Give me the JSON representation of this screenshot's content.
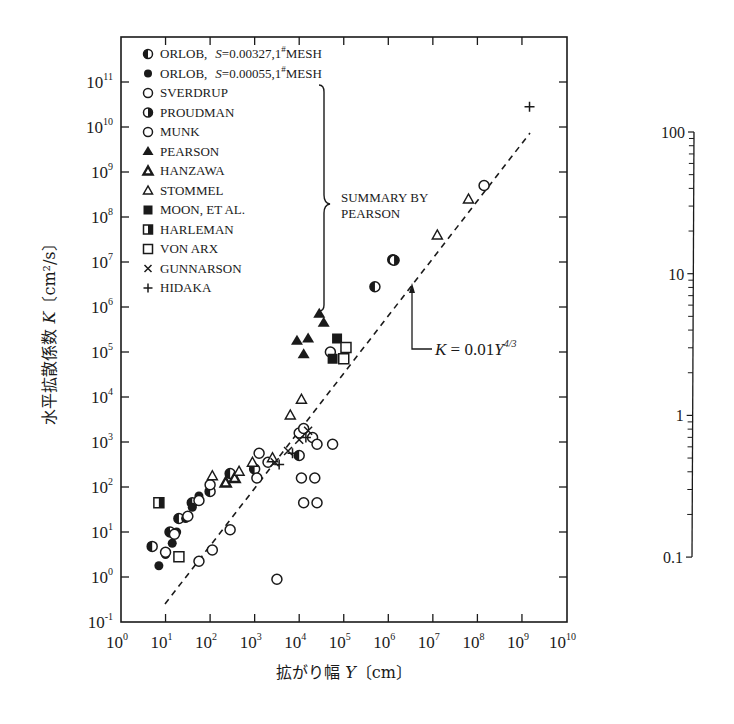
{
  "chart_data": [
    {
      "type": "scatter",
      "title": "",
      "xlabel": "拡がり幅 Y〔cm〕",
      "ylabel": "水平拡散係数 K〔cm²/s〕",
      "xscale": "log",
      "yscale": "log",
      "xlim": [
        1,
        10000000000.0
      ],
      "ylim": [
        0.1,
        1000000000000.0
      ],
      "x_ticks": [
        "10^0",
        "10^1",
        "10^2",
        "10^3",
        "10^4",
        "10^5",
        "10^6",
        "10^7",
        "10^8",
        "10^9",
        "10^10"
      ],
      "y_ticks": [
        "10^-1",
        "10^0",
        "10^1",
        "10^2",
        "10^3",
        "10^4",
        "10^5",
        "10^6",
        "10^7",
        "10^8",
        "10^9",
        "10^10",
        "10^11"
      ],
      "grid": false,
      "legend_position": "upper left (inside)",
      "legend_group_label": "SUMMARY BY PEARSON",
      "annotation": {
        "text": "K = 0.01Y^4/3",
        "arrow_to_log": [
          6.35,
          7.65
        ]
      },
      "fit_line": {
        "label": "K = 0.01Y^(4/3)",
        "style": "dashed",
        "x_range_log": [
          1,
          9.2
        ]
      },
      "series": [
        {
          "name": "ORLOB, S=0.00327, 1#MESH",
          "marker": "circle-half-left",
          "points_log": [
            [
              0.7,
              0.68
            ],
            [
              1.1,
              1.0
            ],
            [
              1.3,
              1.3
            ],
            [
              1.6,
              1.65
            ],
            [
              2.0,
              1.9
            ],
            [
              2.45,
              2.3
            ],
            [
              3.0,
              2.4
            ],
            [
              4.0,
              2.7
            ],
            [
              5.7,
              6.45
            ],
            [
              6.1,
              7.05
            ]
          ]
        },
        {
          "name": "ORLOB, S=0.00055, 1#MESH",
          "marker": "circle-filled",
          "points_log": [
            [
              0.85,
              0.25
            ],
            [
              1.0,
              0.5
            ],
            [
              1.15,
              0.75
            ],
            [
              1.25,
              1.0
            ],
            [
              1.45,
              1.3
            ],
            [
              1.6,
              1.55
            ],
            [
              1.75,
              1.8
            ]
          ]
        },
        {
          "name": "SVERDRUP",
          "marker": "circle-open",
          "points_log": [
            [
              1.0,
              0.55
            ],
            [
              1.2,
              0.95
            ],
            [
              1.5,
              1.35
            ],
            [
              1.75,
              1.7
            ],
            [
              2.0,
              2.05
            ]
          ]
        },
        {
          "name": "PROUDMAN",
          "marker": "circle-half-right",
          "points_log": [
            [
              6.13,
              7.04
            ]
          ]
        },
        {
          "name": "MUNK",
          "marker": "circle-open",
          "points_log": [
            [
              1.75,
              0.35
            ],
            [
              2.05,
              0.6
            ],
            [
              2.45,
              1.05
            ],
            [
              3.05,
              2.2
            ],
            [
              3.3,
              2.55
            ],
            [
              3.1,
              2.75
            ],
            [
              4.0,
              3.2
            ],
            [
              4.1,
              3.3
            ],
            [
              4.3,
              3.1
            ],
            [
              4.7,
              5.0
            ],
            [
              8.15,
              8.7
            ],
            [
              3.5,
              -0.05
            ],
            [
              4.1,
              1.65
            ],
            [
              4.4,
              1.65
            ],
            [
              4.05,
              2.2
            ],
            [
              4.35,
              2.2
            ],
            [
              4.4,
              2.95
            ],
            [
              4.75,
              2.95
            ]
          ]
        },
        {
          "name": "PEARSON",
          "marker": "triangle-filled",
          "points_log": [
            [
              3.95,
              5.25
            ],
            [
              4.2,
              5.3
            ],
            [
              4.1,
              4.95
            ],
            [
              4.45,
              5.85
            ],
            [
              4.55,
              5.65
            ]
          ]
        },
        {
          "name": "HANZAWA",
          "marker": "triangle-filled-small",
          "points_log": [
            [
              2.35,
              2.1
            ],
            [
              2.55,
              2.2
            ]
          ]
        },
        {
          "name": "STOMMEL",
          "marker": "triangle-open",
          "points_log": [
            [
              2.05,
              2.25
            ],
            [
              2.65,
              2.35
            ],
            [
              2.95,
              2.55
            ],
            [
              3.4,
              2.65
            ],
            [
              3.8,
              3.6
            ],
            [
              4.05,
              3.95
            ],
            [
              7.1,
              7.6
            ],
            [
              7.8,
              8.4
            ]
          ]
        },
        {
          "name": "MOON, ET AL.",
          "marker": "square-filled",
          "points_log": [
            [
              4.85,
              5.3
            ],
            [
              4.75,
              4.85
            ]
          ]
        },
        {
          "name": "HARLEMAN",
          "marker": "square-half",
          "points_log": [
            [
              0.85,
              1.65
            ]
          ]
        },
        {
          "name": "VON ARX",
          "marker": "square-open",
          "points_log": [
            [
              5.05,
              5.1
            ],
            [
              5.0,
              4.85
            ],
            [
              1.3,
              0.45
            ]
          ]
        },
        {
          "name": "GUNNARSON",
          "marker": "cross-x",
          "points_log": [
            [
              3.45,
              2.55
            ],
            [
              3.75,
              2.8
            ],
            [
              4.0,
              3.05
            ],
            [
              4.2,
              3.25
            ]
          ]
        },
        {
          "name": "HIDAKA",
          "marker": "plus",
          "points_log": [
            [
              9.17,
              10.45
            ],
            [
              3.55,
              2.5
            ],
            [
              3.85,
              2.75
            ],
            [
              4.15,
              3.1
            ]
          ]
        }
      ]
    },
    {
      "type": "line",
      "title": "",
      "yscale": "log",
      "ylim": [
        0.1,
        100
      ],
      "y_ticks": [
        "0.1",
        "1",
        "10",
        "100"
      ],
      "note": "standalone secondary log axis with minor ticks, no data"
    }
  ],
  "axes": {
    "x_ticks": [
      {
        "base": "10",
        "exp": "0"
      },
      {
        "base": "10",
        "exp": "1"
      },
      {
        "base": "10",
        "exp": "2"
      },
      {
        "base": "10",
        "exp": "3"
      },
      {
        "base": "10",
        "exp": "4"
      },
      {
        "base": "10",
        "exp": "5"
      },
      {
        "base": "10",
        "exp": "6"
      },
      {
        "base": "10",
        "exp": "7"
      },
      {
        "base": "10",
        "exp": "8"
      },
      {
        "base": "10",
        "exp": "9"
      },
      {
        "base": "10",
        "exp": "10"
      }
    ],
    "y_ticks": [
      {
        "base": "10",
        "exp": "-1"
      },
      {
        "base": "10",
        "exp": "0"
      },
      {
        "base": "10",
        "exp": "1"
      },
      {
        "base": "10",
        "exp": "2"
      },
      {
        "base": "10",
        "exp": "3"
      },
      {
        "base": "10",
        "exp": "4"
      },
      {
        "base": "10",
        "exp": "5"
      },
      {
        "base": "10",
        "exp": "6"
      },
      {
        "base": "10",
        "exp": "7"
      },
      {
        "base": "10",
        "exp": "8"
      },
      {
        "base": "10",
        "exp": "9"
      },
      {
        "base": "10",
        "exp": "10"
      },
      {
        "base": "10",
        "exp": "11"
      }
    ],
    "xlabel_text": "拡がり幅 ",
    "xlabel_var": "Y",
    "xlabel_unit": "〔cm〕",
    "ylabel_text": "水平拡散係数 ",
    "ylabel_var": "K",
    "ylabel_unit": "〔cm²/s〕"
  },
  "legend": {
    "items": [
      {
        "label": "ORLOB,",
        "s_text": "S = 0.00327,1",
        "sup": "#",
        "suffix": "MESH"
      },
      {
        "label": "ORLOB,",
        "s_text": "S = 0.00055,1",
        "sup": "#",
        "suffix": "MESH"
      },
      {
        "label": "SVERDRUP"
      },
      {
        "label": "PROUDMAN"
      },
      {
        "label": "MUNK"
      },
      {
        "label": "PEARSON"
      },
      {
        "label": "HANZAWA"
      },
      {
        "label": "STOMMEL"
      },
      {
        "label": "MOON, ET AL."
      },
      {
        "label": "HARLEMAN"
      },
      {
        "label": "VON ARX"
      },
      {
        "label": "GUNNARSON"
      },
      {
        "label": "HIDAKA"
      }
    ],
    "group_label_line1": "SUMMARY BY",
    "group_label_line2": "PEARSON"
  },
  "annotation": {
    "k": "K",
    "eq": " = 0.01",
    "y": "Y",
    "exp": "4/3"
  },
  "right_axis": {
    "labels": [
      "100",
      "10",
      "1",
      "0.1"
    ]
  },
  "colors": {
    "ink": "#1a1a1a",
    "background": "#ffffff"
  }
}
